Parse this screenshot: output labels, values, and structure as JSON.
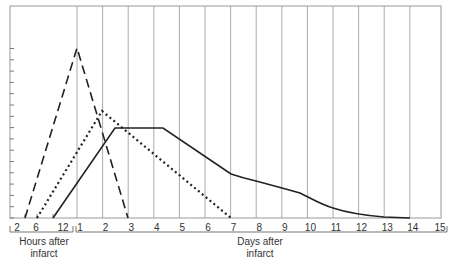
{
  "chart_data": {
    "type": "line",
    "title": "",
    "xlabel_hours": [
      "Hours after",
      "infarct"
    ],
    "xlabel_days": [
      "Days after",
      "infarct"
    ],
    "ylabel": "",
    "x_tick_labels_hours": [
      "2",
      "6",
      "12"
    ],
    "x_tick_labels_days": [
      "1",
      "2",
      "3",
      "4",
      "5",
      "6",
      "7",
      "8",
      "9",
      "10",
      "11",
      "12",
      "13",
      "14",
      "15"
    ],
    "y_ticks_count": 15,
    "y_tick_labels": [],
    "grid": "vertical lines at each day",
    "legend": "none",
    "units_note": "x in days (hours region before day 1 expressed as fraction of day 1 axis segment); y in tick units (unlabeled)",
    "series": [
      {
        "name": "dashed",
        "style": "dashed",
        "points": [
          [
            "~4h",
            0
          ],
          [
            "day 1",
            15
          ],
          [
            "day 3",
            0
          ]
        ]
      },
      {
        "name": "dotted",
        "style": "dotted",
        "points": [
          [
            "~6h",
            0
          ],
          [
            "day 2",
            9.5
          ],
          [
            "day 7",
            0
          ]
        ]
      },
      {
        "name": "solid",
        "style": "solid",
        "points": [
          [
            "~10h",
            0
          ],
          [
            "day 2.5",
            8
          ],
          [
            "day 4.4",
            8
          ],
          [
            "day 7",
            4
          ],
          [
            "day 8",
            3.3
          ],
          [
            "day 9",
            2.7
          ],
          [
            "day 10",
            2
          ],
          [
            "day 11",
            1
          ],
          [
            "day 12",
            0.5
          ],
          [
            "day 13",
            0.1
          ],
          [
            "day 14",
            0
          ]
        ]
      }
    ]
  }
}
